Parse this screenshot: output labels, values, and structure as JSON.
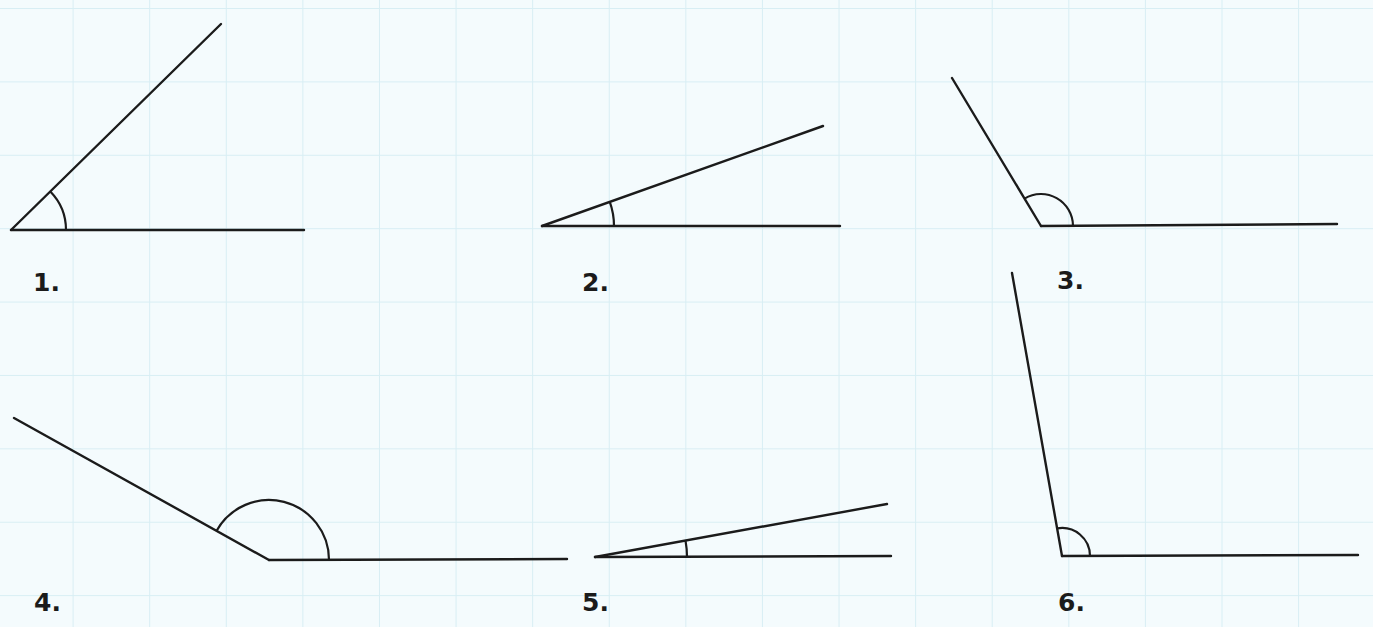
{
  "background": {
    "color": "#f4fbfd",
    "grid_color": "#d8eef4"
  },
  "angles": [
    {
      "label": "1.",
      "vertex": [
        11,
        230
      ],
      "base_end": [
        304,
        230
      ],
      "ray_end": [
        221,
        24
      ],
      "arc_radius": 55,
      "label_pos": [
        33,
        270
      ]
    },
    {
      "label": "2.",
      "vertex": [
        542,
        226
      ],
      "base_end": [
        840,
        226
      ],
      "ray_end": [
        823,
        126
      ],
      "arc_radius": 72,
      "label_pos": [
        582,
        270
      ]
    },
    {
      "label": "3.",
      "vertex": [
        1041,
        226
      ],
      "base_end": [
        1337,
        224
      ],
      "ray_end": [
        952,
        78
      ],
      "arc_radius": 32,
      "label_pos": [
        1057,
        268
      ]
    },
    {
      "label": "4.",
      "vertex": [
        269,
        560
      ],
      "base_end": [
        567,
        559
      ],
      "ray_end": [
        14,
        418
      ],
      "arc_radius": 60,
      "label_pos": [
        34,
        590
      ]
    },
    {
      "label": "5.",
      "vertex": [
        595,
        557
      ],
      "base_end": [
        891,
        556
      ],
      "ray_end": [
        887,
        504
      ],
      "arc_radius": 92,
      "label_pos": [
        582,
        590
      ]
    },
    {
      "label": "6.",
      "vertex": [
        1062,
        556
      ],
      "base_end": [
        1358,
        555
      ],
      "ray_end": [
        1012,
        273
      ],
      "arc_radius": 28,
      "label_pos": [
        1058,
        590
      ]
    }
  ]
}
